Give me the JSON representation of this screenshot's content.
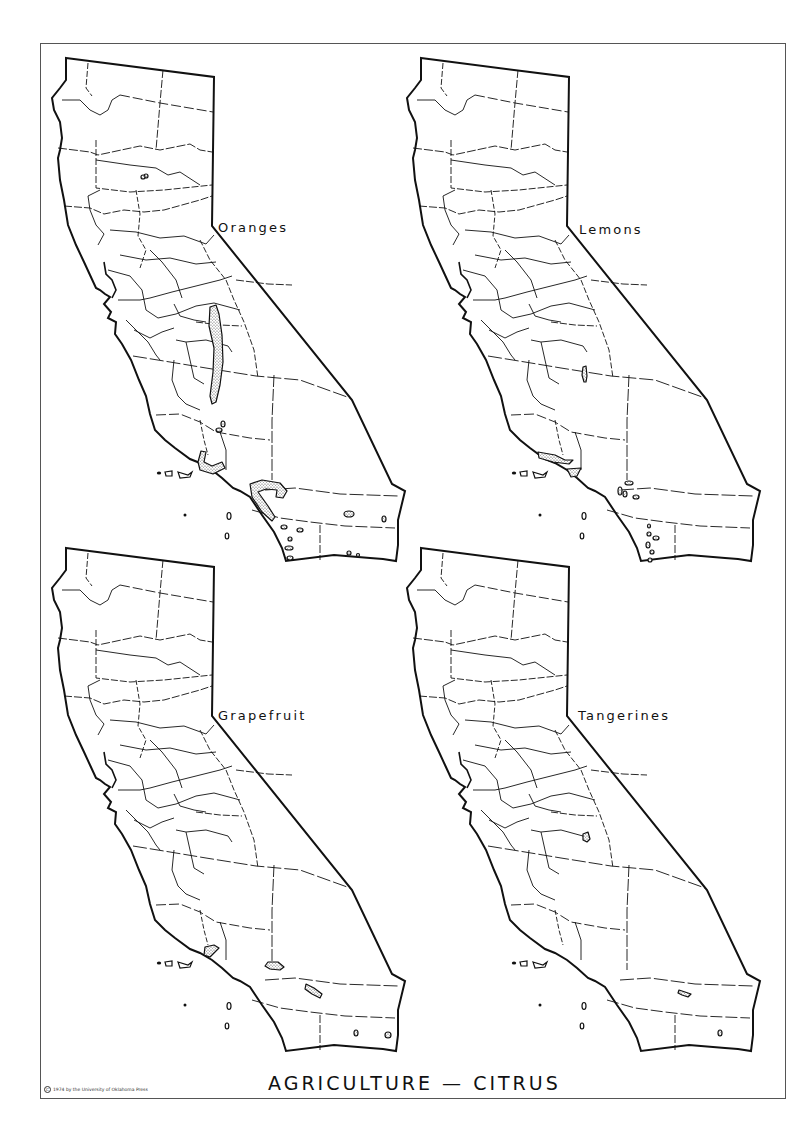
{
  "page": {
    "title": "AGRICULTURE — CITRUS",
    "copyright": "1974 by the University of Oklahoma Press",
    "copyright_symbol": "C"
  },
  "maps": [
    {
      "label": "Oranges",
      "position": "top-left",
      "offset": [
        0,
        0
      ],
      "areas": [
        {
          "type": "band",
          "description": "San Joaquin Valley east side (Tulare/Fresno)",
          "points": "210,307 216,305 219,314 222,335 223,362 220,385 216,402 212,404 210,396 213,372 214,348 209,326"
        },
        {
          "type": "blob",
          "description": "Santa Barbara/Ventura coast",
          "points": "201,451 206,452 204,462 212,466 222,462 225,468 213,474 200,470 198,462"
        },
        {
          "type": "blob",
          "description": "Los Angeles/Orange county hook",
          "points": "250,484 262,480 280,483 287,491 283,498 276,497 277,490 266,489 258,492 268,506 275,517 272,521 262,512 252,497"
        },
        {
          "type": "dot",
          "cx": 223,
          "cy": 424,
          "rx": 2,
          "ry": 3
        },
        {
          "type": "dot",
          "cx": 219,
          "cy": 430,
          "rx": 3,
          "ry": 2
        },
        {
          "type": "dot",
          "cx": 349,
          "cy": 514,
          "rx": 5,
          "ry": 3
        },
        {
          "type": "dot",
          "cx": 284,
          "cy": 527,
          "rx": 3,
          "ry": 2
        },
        {
          "type": "dot",
          "cx": 300,
          "cy": 530,
          "rx": 3,
          "ry": 2
        },
        {
          "type": "dot",
          "cx": 290,
          "cy": 539,
          "rx": 2,
          "ry": 2
        },
        {
          "type": "dot",
          "cx": 289,
          "cy": 548,
          "rx": 4,
          "ry": 2
        },
        {
          "type": "dot",
          "cx": 290,
          "cy": 558,
          "rx": 3,
          "ry": 2
        },
        {
          "type": "dot",
          "cx": 349,
          "cy": 553,
          "rx": 2,
          "ry": 2
        },
        {
          "type": "dot",
          "cx": 358,
          "cy": 555,
          "rx": 1.5,
          "ry": 1.5
        },
        {
          "type": "dot",
          "cx": 384,
          "cy": 519,
          "rx": 2,
          "ry": 3
        },
        {
          "type": "dot",
          "cx": 146,
          "cy": 176,
          "rx": 2,
          "ry": 2
        },
        {
          "type": "dot",
          "cx": 143,
          "cy": 177,
          "rx": 2,
          "ry": 2
        }
      ]
    },
    {
      "label": "Lemons",
      "position": "top-right",
      "offset": [
        355,
        0
      ],
      "areas": [
        {
          "type": "band",
          "description": "Tulare small strip",
          "points": "228,367 231,366 232,376 231,382 229,382 227,375"
        },
        {
          "type": "band",
          "description": "Santa Barbara coast",
          "points": "183,452 200,455 210,460 218,460 214,464 198,462 184,458"
        },
        {
          "type": "blob",
          "description": "Ventura",
          "points": "212,469 226,468 222,476 216,477"
        },
        {
          "type": "dot",
          "cx": 274,
          "cy": 483,
          "rx": 4,
          "ry": 2
        },
        {
          "type": "dot",
          "cx": 265,
          "cy": 491,
          "rx": 2,
          "ry": 4
        },
        {
          "type": "dot",
          "cx": 270,
          "cy": 494,
          "rx": 2,
          "ry": 3
        },
        {
          "type": "dot",
          "cx": 281,
          "cy": 497,
          "rx": 3,
          "ry": 2
        },
        {
          "type": "dot",
          "cx": 294,
          "cy": 526,
          "rx": 1.5,
          "ry": 2
        },
        {
          "type": "dot",
          "cx": 294,
          "cy": 534,
          "rx": 2,
          "ry": 2
        },
        {
          "type": "dot",
          "cx": 301,
          "cy": 538,
          "rx": 3,
          "ry": 2
        },
        {
          "type": "dot",
          "cx": 293,
          "cy": 545,
          "rx": 2,
          "ry": 3
        },
        {
          "type": "dot",
          "cx": 297,
          "cy": 552,
          "rx": 2,
          "ry": 2
        },
        {
          "type": "dot",
          "cx": 295,
          "cy": 560,
          "rx": 2,
          "ry": 2
        }
      ]
    },
    {
      "label": "Grapefruit",
      "position": "bottom-left",
      "offset": [
        0,
        490
      ],
      "areas": [
        {
          "type": "blob",
          "description": "Ventura",
          "points": "205,457 214,455 219,458 214,463 210,467 204,465"
        },
        {
          "type": "blob",
          "description": "San Bernardino/Riverside",
          "points": "268,472 278,472 284,477 280,480 270,479 265,476"
        },
        {
          "type": "blob",
          "description": "Riverside desert (Coachella)",
          "points": "306,494 314,498 322,504 320,508 312,504 305,499"
        },
        {
          "type": "dot",
          "cx": 356,
          "cy": 543,
          "rx": 2,
          "ry": 3
        },
        {
          "type": "dot",
          "cx": 388,
          "cy": 545,
          "rx": 3,
          "ry": 3
        }
      ]
    },
    {
      "label": "Tangerines",
      "position": "bottom-right",
      "offset": [
        355,
        490
      ],
      "areas": [
        {
          "type": "blob",
          "description": "Tulare",
          "points": "228,344 233,342 235,349 232,352 228,350"
        },
        {
          "type": "blob",
          "description": "Riverside desert",
          "points": "324,500 330,502 336,504 333,507 327,505 323,503"
        },
        {
          "type": "dot",
          "cx": 365,
          "cy": 543,
          "rx": 2,
          "ry": 3
        }
      ]
    }
  ],
  "colors": {
    "ink": "#111111",
    "frame": "#555555",
    "paper": "#ffffff",
    "stipple": "#444444"
  }
}
